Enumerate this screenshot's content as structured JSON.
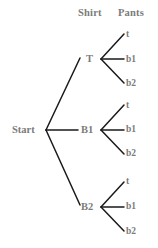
{
  "diagram": {
    "kind": "probability-tree-diagram",
    "width": 158,
    "height": 248,
    "background_color": "#ffffff",
    "line_color": "#1a1a1a",
    "text_color": "#7b7b7b",
    "column_headers": [
      {
        "label": "Shirt",
        "x": 78,
        "y": 8
      },
      {
        "label": "Pants",
        "x": 118,
        "y": 8
      }
    ],
    "root": {
      "label": "Start",
      "x": 12,
      "y": 125
    },
    "shirt_nodes": [
      {
        "label": "T",
        "x": 86,
        "y": 54
      },
      {
        "label": "B1",
        "x": 81,
        "y": 125
      },
      {
        "label": "B2",
        "x": 81,
        "y": 202
      }
    ],
    "pants_nodes": [
      {
        "label": "t",
        "x": 126,
        "y": 30
      },
      {
        "label": "b1",
        "x": 126,
        "y": 55
      },
      {
        "label": "b2",
        "x": 126,
        "y": 79
      },
      {
        "label": "t",
        "x": 126,
        "y": 101
      },
      {
        "label": "b1",
        "x": 126,
        "y": 125
      },
      {
        "label": "b2",
        "x": 126,
        "y": 149
      },
      {
        "label": "t",
        "x": 126,
        "y": 177
      },
      {
        "label": "b1",
        "x": 126,
        "y": 202
      },
      {
        "label": "b2",
        "x": 126,
        "y": 227
      }
    ],
    "edges": {
      "root_vertex": {
        "x": 46,
        "y": 130
      },
      "root_branches": [
        {
          "to_x": 80,
          "to_y": 58
        },
        {
          "to_x": 78,
          "to_y": 130
        },
        {
          "to_x": 80,
          "to_y": 205
        }
      ],
      "shirt_vertices": [
        {
          "x": 101,
          "y": 59
        },
        {
          "x": 101,
          "y": 130
        },
        {
          "x": 101,
          "y": 207
        }
      ],
      "shirt_branch_offsets": [
        -25,
        0,
        24
      ],
      "branch_end_x": 124
    }
  }
}
